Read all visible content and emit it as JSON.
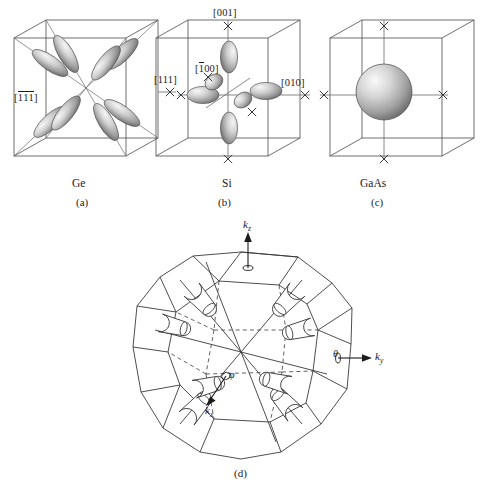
{
  "figure": {
    "background_color": "#ffffff",
    "line_color": "#3a3a3a",
    "surface_fill_light": "#f2f2f2",
    "surface_fill_mid": "#b9b9b9",
    "surface_fill_dark": "#6f6f6f"
  },
  "panels": [
    {
      "id": "panel-a",
      "material": "Ge",
      "panel_label": "(a)",
      "surface_type": "ellipsoids",
      "valley_count": 8,
      "valley_axis_family": "<111>",
      "direction_labels": [
        {
          "name": "dir-111",
          "text": "[111]",
          "overbars": []
        },
        {
          "name": "dir-m1m1m1",
          "text": "[111]",
          "overbars": [
            0,
            1,
            2
          ]
        }
      ]
    },
    {
      "id": "panel-b",
      "material": "Si",
      "panel_label": "(b)",
      "surface_type": "ellipsoids",
      "valley_count": 6,
      "valley_axis_family": "<100>",
      "direction_labels": [
        {
          "name": "dir-001",
          "text": "[001]",
          "overbars": []
        },
        {
          "name": "dir-m100",
          "text": "[100]",
          "overbars": [
            0
          ]
        },
        {
          "name": "dir-010",
          "text": "[010]",
          "overbars": []
        }
      ]
    },
    {
      "id": "panel-c",
      "material": "GaAs",
      "panel_label": "(c)",
      "surface_type": "sphere",
      "valley_count": 1,
      "valley_axis_family": "Gamma",
      "direction_labels": []
    }
  ],
  "brillouin_zone": {
    "id": "panel-d",
    "panel_label": "(d)",
    "shape": "truncated-octahedron",
    "valley_count": 8,
    "valley_axis_family": "<111> L-points",
    "axes": [
      {
        "name": "axis-kz",
        "symbol": "k",
        "subscript": "z"
      },
      {
        "name": "axis-ky",
        "symbol": "k",
        "subscript": "y"
      },
      {
        "name": "axis-kx",
        "symbol": "k",
        "subscript": "x"
      }
    ],
    "angles": [
      {
        "name": "angle-phi",
        "symbol": "φ"
      },
      {
        "name": "angle-theta",
        "symbol": "θ"
      }
    ]
  },
  "symmetry_point_marks": {
    "name": "x-point-marker",
    "glyph": "X",
    "count_panel_b": 4,
    "count_panel_c": 4,
    "count_panel_a": 1
  }
}
